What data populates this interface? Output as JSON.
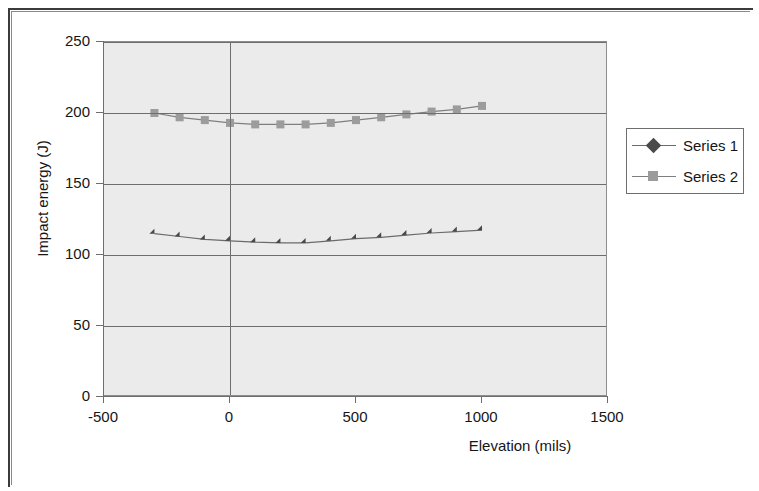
{
  "chart_data": {
    "type": "line",
    "title": "",
    "xlabel": "Elevation (mils)",
    "ylabel": "Impact energy (J)",
    "xlim": [
      -500,
      1500
    ],
    "ylim": [
      0,
      250
    ],
    "xticks": [
      "-500",
      "0",
      "500",
      "1000",
      "1500"
    ],
    "xtick_values": [
      -500,
      0,
      500,
      1000,
      1500
    ],
    "yticks": [
      "0",
      "50",
      "100",
      "150",
      "200",
      "250"
    ],
    "ytick_values": [
      0,
      50,
      100,
      150,
      200,
      250
    ],
    "grid": "horizontal",
    "legend_position": "right",
    "x": [
      -300,
      -200,
      -100,
      0,
      100,
      200,
      300,
      400,
      500,
      600,
      700,
      800,
      900,
      1000
    ],
    "series": [
      {
        "name": "Series 1",
        "marker": "diamond",
        "color": "#4a4a4a",
        "line_color": "#6b6b6b",
        "values": [
          115,
          113,
          111,
          110,
          109,
          108.5,
          108.5,
          110,
          111.5,
          112.5,
          114,
          115.5,
          116.5,
          117.5
        ]
      },
      {
        "name": "Series 2",
        "marker": "square",
        "color": "#9c9c9c",
        "line_color": "#7f7f7f",
        "values": [
          200,
          197,
          195,
          193,
          192,
          192,
          192,
          193,
          195,
          197,
          199,
          201,
          202.5,
          205
        ]
      }
    ]
  },
  "legend": {
    "entries": [
      {
        "label": "Series 1"
      },
      {
        "label": "Series 2"
      }
    ]
  },
  "colors": {
    "plot_background": "#ebebeb",
    "page_background": "#ffffff",
    "gridline": "#6e6e6e",
    "axis": "#6e6e6e",
    "text": "#161616",
    "frame": "#3b3b3b"
  }
}
